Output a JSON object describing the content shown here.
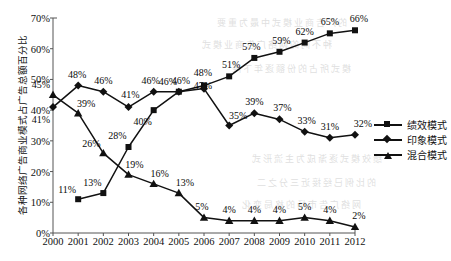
{
  "chart_data": {
    "type": "line",
    "title": "",
    "xlabel": "",
    "ylabel": "各种网络广告商业模式占广告总额百分比",
    "ylim": [
      0,
      70
    ],
    "ytick_labels": [
      "0%",
      "10%",
      "20%",
      "30%",
      "40%",
      "50%",
      "60%",
      "70%"
    ],
    "ytick_values": [
      0,
      10,
      20,
      30,
      40,
      50,
      60,
      70
    ],
    "grid": false,
    "legend_position": "right",
    "categories": [
      "2000",
      "2001",
      "2002",
      "2003",
      "2004",
      "2005",
      "2006",
      "2007",
      "2008",
      "2009",
      "2010",
      "2011",
      "2012"
    ],
    "series": [
      {
        "name": "绩效模式",
        "marker": "square",
        "values": [
          null,
          11,
          13,
          28,
          40,
          46,
          48,
          51,
          57,
          59,
          62,
          65,
          66
        ],
        "labels": [
          "",
          "11%",
          "13%",
          "28%",
          "40%",
          "46%",
          "48%",
          "51%",
          "57%",
          "59%",
          "62%",
          "65%",
          "66%"
        ]
      },
      {
        "name": "印象模式",
        "marker": "diamond",
        "values": [
          41,
          48,
          46,
          41,
          46,
          46,
          47,
          35,
          39,
          37,
          33,
          31,
          32
        ],
        "labels": [
          "41%",
          "48%",
          "46%",
          "41%",
          "46%",
          "46%",
          "47%",
          "35%",
          "39%",
          "37%",
          "33%",
          "31%",
          "32%"
        ]
      },
      {
        "name": "混合模式",
        "marker": "triangle",
        "values": [
          45,
          39,
          26,
          19,
          16,
          13,
          5,
          4,
          4,
          4,
          5,
          4,
          2
        ],
        "labels": [
          "45%",
          "39%",
          "26%",
          "19%",
          "16%",
          "13%",
          "5%",
          "4%",
          "4%",
          "4%",
          "5%",
          "4%",
          "2%"
        ]
      }
    ],
    "colors": {
      "line": "#111111",
      "axis": "#555555",
      "background": "#ffffff"
    }
  },
  "legend": {
    "items": [
      {
        "label": "绩效模式",
        "marker": "square"
      },
      {
        "label": "印象模式",
        "marker": "diamond"
      },
      {
        "label": "混合模式",
        "marker": "triangle"
      }
    ]
  },
  "background_bleed": {
    "lines": [
      "的广告商业模式中最为重要",
      "种不同的网络广告商业模式",
      "模式所占的份额逐年下降",
      "绩效模式逐渐成为主流形式",
      "的比例已经接近三分之二",
      "网络广告市场的格局变化"
    ]
  }
}
